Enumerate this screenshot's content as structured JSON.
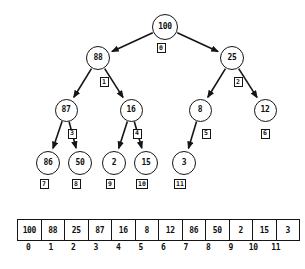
{
  "diagram": {
    "stroke_color": "#151515",
    "fill_color": "#ffffff",
    "nodes": [
      {
        "value": "100",
        "index": "0",
        "cx": 165,
        "cy": 27,
        "r": 13
      },
      {
        "value": "88",
        "index": "1",
        "cx": 98,
        "cy": 58,
        "r": 12
      },
      {
        "value": "25",
        "index": "2",
        "cx": 232,
        "cy": 58,
        "r": 12
      },
      {
        "value": "87",
        "index": "3",
        "cx": 66,
        "cy": 110,
        "r": 11.5
      },
      {
        "value": "16",
        "index": "4",
        "cx": 131,
        "cy": 110,
        "r": 11.5
      },
      {
        "value": "8",
        "index": "5",
        "cx": 200,
        "cy": 110,
        "r": 11.5
      },
      {
        "value": "12",
        "index": "6",
        "cx": 265,
        "cy": 110,
        "r": 11.5
      },
      {
        "value": "86",
        "index": "7",
        "cx": 48,
        "cy": 163,
        "r": 12
      },
      {
        "value": "50",
        "index": "8",
        "cx": 80,
        "cy": 163,
        "r": 12
      },
      {
        "value": "2",
        "index": "9",
        "cx": 114,
        "cy": 163,
        "r": 12
      },
      {
        "value": "15",
        "index": "10",
        "cx": 146,
        "cy": 163,
        "r": 12
      },
      {
        "value": "3",
        "index": "11",
        "cx": 184,
        "cy": 163,
        "r": 12
      }
    ],
    "edges": [
      {
        "from": "0",
        "to": "1"
      },
      {
        "from": "0",
        "to": "2"
      },
      {
        "from": "1",
        "to": "3"
      },
      {
        "from": "1",
        "to": "4"
      },
      {
        "from": "2",
        "to": "5"
      },
      {
        "from": "2",
        "to": "6"
      },
      {
        "from": "3",
        "to": "7"
      },
      {
        "from": "3",
        "to": "8"
      },
      {
        "from": "4",
        "to": "9"
      },
      {
        "from": "4",
        "to": "10"
      },
      {
        "from": "5",
        "to": "11"
      }
    ]
  },
  "array": {
    "values": [
      "100",
      "88",
      "25",
      "87",
      "16",
      "8",
      "12",
      "86",
      "50",
      "2",
      "15",
      "3"
    ],
    "indices": [
      "0",
      "1",
      "2",
      "3",
      "4",
      "5",
      "6",
      "7",
      "8",
      "9",
      "10",
      "11"
    ]
  },
  "chart_data": {
    "type": "diagram",
    "tree": {
      "root": "100",
      "levels": [
        [
          "100"
        ],
        [
          "88",
          "25"
        ],
        [
          "87",
          "16",
          "8",
          "12"
        ],
        [
          "86",
          "50",
          "2",
          "15",
          "3"
        ]
      ],
      "node_values": [
        "100",
        "88",
        "25",
        "87",
        "16",
        "8",
        "12",
        "86",
        "50",
        "2",
        "15",
        "3"
      ],
      "node_indices": [
        "0",
        "1",
        "2",
        "3",
        "4",
        "5",
        "6",
        "7",
        "8",
        "9",
        "10",
        "11"
      ],
      "parent_of": [
        null,
        "0",
        "0",
        "1",
        "1",
        "2",
        "2",
        "3",
        "3",
        "4",
        "4",
        "5"
      ]
    },
    "array": {
      "values": [
        100,
        88,
        25,
        87,
        16,
        8,
        12,
        86,
        50,
        2,
        15,
        3
      ],
      "indices": [
        0,
        1,
        2,
        3,
        4,
        5,
        6,
        7,
        8,
        9,
        10,
        11
      ]
    }
  }
}
